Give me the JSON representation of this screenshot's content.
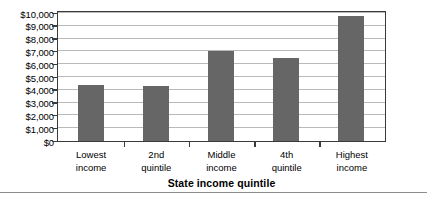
{
  "chart_data": {
    "type": "bar",
    "title": "",
    "xlabel": "State income quintile",
    "ylabel": "",
    "categories": [
      "Lowest income",
      "2nd quintile",
      "Middle income",
      "4th quintile",
      "Highest income"
    ],
    "category_lines": [
      [
        "Lowest",
        "income"
      ],
      [
        "2nd",
        "quintile"
      ],
      [
        "Middle",
        "income"
      ],
      [
        "4th",
        "quintile"
      ],
      [
        "Highest",
        "income"
      ]
    ],
    "values": [
      4400,
      4300,
      7050,
      6450,
      9800
    ],
    "ylim": [
      0,
      10000
    ],
    "ytick_step": 1000,
    "ytick_labels": [
      "$10,000",
      "$9,000",
      "$8,000",
      "$7,000",
      "$6,000",
      "$5,000",
      "$4,000",
      "$3,000",
      "$2,000",
      "$1,000",
      "$0"
    ],
    "ytick_values": [
      10000,
      9000,
      8000,
      7000,
      6000,
      5000,
      4000,
      3000,
      2000,
      1000,
      0
    ],
    "grid": true,
    "legend": "none",
    "colors": {
      "bar": "#666666",
      "gridline": "#b9b9b9",
      "axis": "#3a3a3a",
      "background": "#ffffff",
      "rule": "#8c8c8c"
    }
  }
}
